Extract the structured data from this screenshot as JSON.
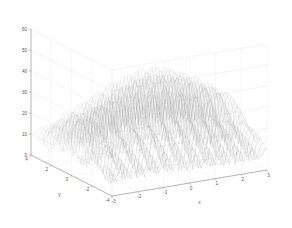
{
  "figure": {
    "background_color": "#ffffff",
    "line_color": "#9a9a9a",
    "axis_color": "#b0b0b0",
    "tick_text_color": "#555555"
  },
  "chart_data": {
    "type": "line",
    "render_style": "3d-mesh-waterfall",
    "title": "",
    "subtitle": "",
    "xlabel": "x",
    "ylabel": "y",
    "zlabel": "",
    "xlim": [
      -3,
      3
    ],
    "ylim": [
      -4,
      4
    ],
    "zlim": [
      0,
      60
    ],
    "xticks": [
      -3,
      -2,
      -1,
      0,
      1,
      2,
      3
    ],
    "yticks": [
      4,
      2,
      0,
      -2,
      -4
    ],
    "zticks": [
      0,
      10,
      20,
      30,
      40,
      50,
      60
    ],
    "xticklabels": [
      "-3",
      "-2",
      "-1",
      "0",
      "1",
      "2",
      "3"
    ],
    "yticklabels": [
      "4",
      "2",
      "0",
      "-2",
      "-4"
    ],
    "zticklabels": [
      "0",
      "10",
      "20",
      "30",
      "40",
      "50",
      "60"
    ],
    "grid": true,
    "legend": null,
    "legend_position": "none",
    "annotations": [],
    "view": {
      "azimuth": -37.5,
      "elevation": 30
    },
    "series": [
      {
        "name": "mesh-row-y-4.0",
        "y": 4.0,
        "peak": 47,
        "base": 2
      },
      {
        "name": "mesh-row-y-3.0",
        "y": 3.0,
        "peak": 49,
        "base": 2
      },
      {
        "name": "mesh-row-y-2.0",
        "y": 2.0,
        "peak": 52,
        "base": 3
      },
      {
        "name": "mesh-row-y-1.0",
        "y": 1.0,
        "peak": 55,
        "base": 3
      },
      {
        "name": "mesh-row-y-0.0",
        "y": 0.0,
        "peak": 58,
        "base": 3
      },
      {
        "name": "mesh-row-y--1.0",
        "y": -1.0,
        "peak": 54,
        "base": 3
      },
      {
        "name": "mesh-row-y--2.0",
        "y": -2.0,
        "peak": 48,
        "base": 2
      },
      {
        "name": "mesh-row-y--3.0",
        "y": -3.0,
        "peak": 42,
        "base": 2
      },
      {
        "name": "mesh-row-y--4.0",
        "y": -4.0,
        "peak": 36,
        "base": 2
      }
    ],
    "oscillation": {
      "cycles_along_x": 11,
      "amplitude_max": 28,
      "base_ripple_amplitude": 9
    }
  }
}
